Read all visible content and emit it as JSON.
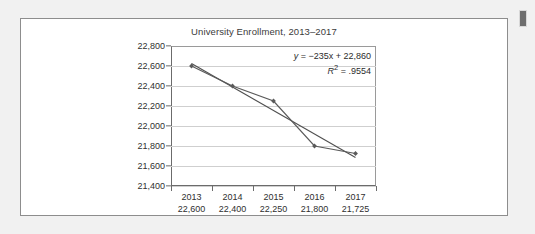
{
  "page": {
    "background_color": "#f1f1f1",
    "card_border_color": "#8d8d8d",
    "marker_color": "#6e6e6e"
  },
  "chart_data": {
    "type": "line",
    "title": "University Enrollment, 2013–2017",
    "xlabel": "",
    "ylabel": "",
    "categories": [
      "2013",
      "2014",
      "2015",
      "2016",
      "2017"
    ],
    "values": [
      22600,
      22400,
      22250,
      21800,
      21725
    ],
    "value_labels": [
      "22,600",
      "22,400",
      "22,250",
      "21,800",
      "21,725"
    ],
    "ylim": [
      21400,
      22800
    ],
    "ytick_labels": [
      "22,800",
      "22,600",
      "22,400",
      "22,200",
      "22,000",
      "21,800",
      "21,600",
      "21,400"
    ],
    "ytick_values": [
      22800,
      22600,
      22400,
      22200,
      22000,
      21800,
      21600,
      21400
    ],
    "grid": true,
    "legend": "none",
    "series": [
      {
        "name": "Enrollment",
        "values": [
          22600,
          22400,
          22250,
          21800,
          21725
        ],
        "marker": "diamond",
        "color": "#5a5a5a"
      },
      {
        "name": "Linear trendline",
        "type": "trendline",
        "equation_slope": -235,
        "equation_intercept": 22860,
        "values": [
          22625,
          22390,
          22155,
          21920,
          21685
        ],
        "color": "#4f4f4f"
      }
    ],
    "annotations": {
      "equation_y": "y",
      "equation_rest": " = −235x + 22,860",
      "r_squared_symbol": "R",
      "r_squared_exponent": "2",
      "r_squared_rest": " = .9554"
    },
    "series_color": "#5a5a5a",
    "trendline_color": "#4f4f4f",
    "gridline_color": "#cfcfcf",
    "axis_color": "#6b6b6b",
    "text_color": "#2f2f2f"
  }
}
